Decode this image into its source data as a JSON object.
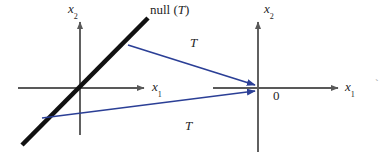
{
  "figure": {
    "colors": {
      "axis": "#595959",
      "null_line": "#111111",
      "arrow": "#2b3f96",
      "text": "#262626",
      "background": "#ffffff"
    },
    "left_diagram": {
      "origin": {
        "x": 80,
        "y": 88
      },
      "x_axis_label": "x",
      "x_axis_subscript": "1",
      "y_axis_label": "x",
      "y_axis_subscript": "2",
      "null_space_label": "null (",
      "null_space_operator": "T",
      "null_space_label_close": ")",
      "null_line": {
        "x1": 22,
        "y1": 145,
        "x2": 147,
        "y2": 18,
        "slope": "positive"
      }
    },
    "right_diagram": {
      "origin": {
        "x": 258,
        "y": 88
      },
      "x_axis_label": "x",
      "x_axis_subscript": "1",
      "y_axis_label": "x",
      "y_axis_subscript": "2",
      "origin_label": "0"
    },
    "maps": [
      {
        "label": "T",
        "name": "upper-map-arrow",
        "from": {
          "x": 128,
          "y": 45
        },
        "to": {
          "x": 256,
          "y": 85
        },
        "label_position": {
          "x": 190,
          "y": 36
        }
      },
      {
        "label": "T",
        "name": "lower-map-arrow",
        "from": {
          "x": 42,
          "y": 118
        },
        "to": {
          "x": 256,
          "y": 91
        },
        "label_position": {
          "x": 185,
          "y": 119
        }
      }
    ],
    "edge_artifact": "ˋ"
  }
}
